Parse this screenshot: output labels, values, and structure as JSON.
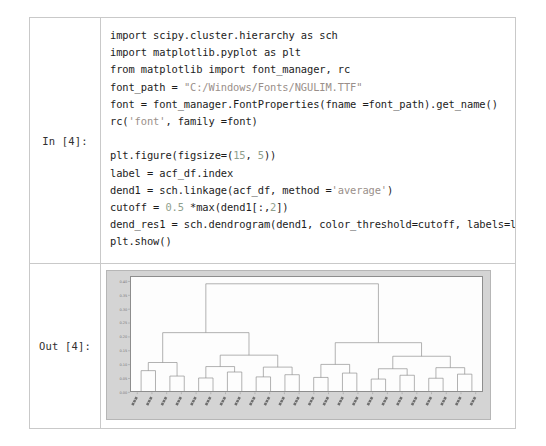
{
  "notebook": {
    "in_prompt": "In [4]:",
    "out_prompt": "Out [4]:",
    "code_lines": [
      [
        {
          "t": "import scipy.cluster.hierarchy as sch",
          "c": "plain"
        }
      ],
      [
        {
          "t": "import matplotlib.pyplot as plt",
          "c": "plain"
        }
      ],
      [
        {
          "t": "from matplotlib import font_manager, rc",
          "c": "plain"
        }
      ],
      [
        {
          "t": "font_path = ",
          "c": "plain"
        },
        {
          "t": "\"C:/Windows/Fonts/NGULIM.TTF\"",
          "c": "str"
        }
      ],
      [
        {
          "t": "font = font_manager.FontProperties(fname =font_path).get_name()",
          "c": "plain"
        }
      ],
      [
        {
          "t": "rc(",
          "c": "plain"
        },
        {
          "t": "'font'",
          "c": "str"
        },
        {
          "t": ", family =font)",
          "c": "plain"
        }
      ],
      [],
      [
        {
          "t": "plt.figure(figsize=(",
          "c": "plain"
        },
        {
          "t": "15",
          "c": "num"
        },
        {
          "t": ", ",
          "c": "plain"
        },
        {
          "t": "5",
          "c": "num"
        },
        {
          "t": "))",
          "c": "plain"
        }
      ],
      [
        {
          "t": "label = acf_df.index",
          "c": "plain"
        }
      ],
      [
        {
          "t": "dend1 = sch.linkage(acf_df, method =",
          "c": "plain"
        },
        {
          "t": "'average'",
          "c": "str"
        },
        {
          "t": ")",
          "c": "plain"
        }
      ],
      [
        {
          "t": "cutoff = ",
          "c": "plain"
        },
        {
          "t": "0.5",
          "c": "num"
        },
        {
          "t": " *max(dend1[:,",
          "c": "plain"
        },
        {
          "t": "2",
          "c": "num"
        },
        {
          "t": "])",
          "c": "plain"
        }
      ],
      [
        {
          "t": "dend_res1 = sch.dendrogram(dend1, color_threshold=cutoff, labels=label)",
          "c": "plain"
        }
      ],
      [
        {
          "t": "plt.show()",
          "c": "plain"
        }
      ]
    ]
  },
  "chart_data": {
    "type": "dendrogram",
    "title": "",
    "xlabel": "",
    "ylabel": "",
    "ylim": [
      0.0,
      0.42
    ],
    "grid": false,
    "legend": null,
    "yticks": [
      0.0,
      0.05,
      0.1,
      0.15,
      0.2,
      0.25,
      0.3,
      0.35,
      0.4
    ],
    "ytick_labels": [
      "0.00",
      "0.05",
      "0.10",
      "0.15",
      "0.20",
      "0.25",
      "0.30",
      "0.35",
      "0.40"
    ],
    "n_leaves": 24,
    "leaf_labels": [
      "",
      "",
      "",
      "",
      "",
      "",
      "",
      "",
      "",
      "",
      "",
      "",
      "",
      "",
      "",
      "",
      "",
      "",
      "",
      "",
      "",
      "",
      "",
      ""
    ],
    "leaf_label_note": "rotated CJK (Korean) category names, illegible at screenshot resolution",
    "link_color": "#8c8c8c",
    "links": [
      {
        "x1": 0,
        "x2": 1,
        "h": 0.075,
        "l": "leaf",
        "r": "leaf"
      },
      {
        "x1": 2,
        "x2": 3,
        "h": 0.055,
        "l": "leaf",
        "r": "leaf"
      },
      {
        "x1": 0.5,
        "x2": 2.5,
        "h": 0.105,
        "l": "n0",
        "r": "n1"
      },
      {
        "x1": 4,
        "x2": 5,
        "h": 0.048,
        "l": "leaf",
        "r": "leaf"
      },
      {
        "x1": 6,
        "x2": 7,
        "h": 0.07,
        "l": "leaf",
        "r": "leaf"
      },
      {
        "x1": 4.5,
        "x2": 6.5,
        "h": 0.09,
        "l": "n3",
        "r": "n4"
      },
      {
        "x1": 8,
        "x2": 9,
        "h": 0.052,
        "l": "leaf",
        "r": "leaf"
      },
      {
        "x1": 10,
        "x2": 11,
        "h": 0.06,
        "l": "leaf",
        "r": "leaf"
      },
      {
        "x1": 8.5,
        "x2": 10.5,
        "h": 0.088,
        "l": "n6",
        "r": "n7"
      },
      {
        "x1": 5.5,
        "x2": 9.5,
        "h": 0.132,
        "l": "n5",
        "r": "n8"
      },
      {
        "x1": 1.5,
        "x2": 7.5,
        "h": 0.215,
        "l": "n2",
        "r": "n9"
      },
      {
        "x1": 12,
        "x2": 13,
        "h": 0.05,
        "l": "leaf",
        "r": "leaf"
      },
      {
        "x1": 14,
        "x2": 15,
        "h": 0.066,
        "l": "leaf",
        "r": "leaf"
      },
      {
        "x1": 12.5,
        "x2": 14.5,
        "h": 0.098,
        "l": "n11",
        "r": "n12"
      },
      {
        "x1": 16,
        "x2": 17,
        "h": 0.044,
        "l": "leaf",
        "r": "leaf"
      },
      {
        "x1": 18,
        "x2": 19,
        "h": 0.058,
        "l": "leaf",
        "r": "leaf"
      },
      {
        "x1": 16.5,
        "x2": 18.5,
        "h": 0.082,
        "l": "n14",
        "r": "n15"
      },
      {
        "x1": 20,
        "x2": 21,
        "h": 0.047,
        "l": "leaf",
        "r": "leaf"
      },
      {
        "x1": 22,
        "x2": 23,
        "h": 0.062,
        "l": "leaf",
        "r": "leaf"
      },
      {
        "x1": 20.5,
        "x2": 22.5,
        "h": 0.086,
        "l": "n17",
        "r": "n18"
      },
      {
        "x1": 17.5,
        "x2": 21.5,
        "h": 0.128,
        "l": "n16",
        "r": "n19"
      },
      {
        "x1": 13.5,
        "x2": 19.5,
        "h": 0.178,
        "l": "n13",
        "r": "n20"
      },
      {
        "x1": 4.5,
        "x2": 16.5,
        "h": 0.395,
        "l": "n10",
        "r": "n21"
      }
    ]
  }
}
